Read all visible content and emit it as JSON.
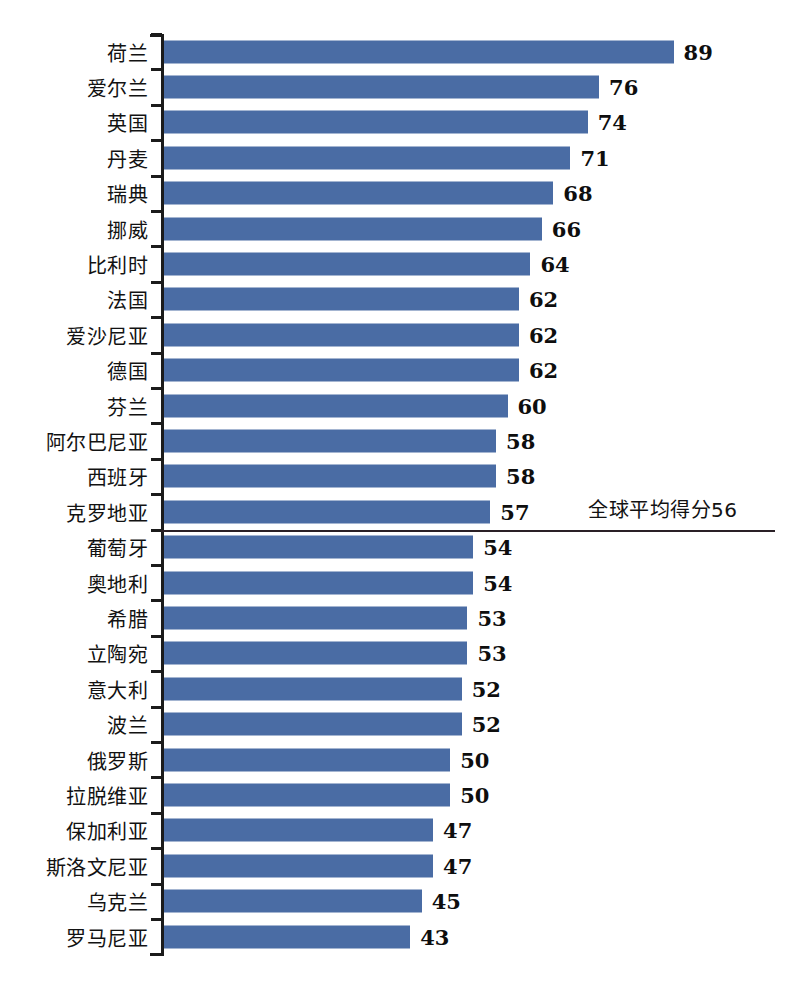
{
  "chart_data": {
    "type": "bar",
    "orientation": "horizontal",
    "title": "",
    "subtitle": "",
    "xlabel": "",
    "ylabel": "",
    "grid": false,
    "legend": null,
    "xlim": [
      0,
      89
    ],
    "categories": [
      "荷兰",
      "爱尔兰",
      "英国",
      "丹麦",
      "瑞典",
      "挪威",
      "比利时",
      "法国",
      "爱沙尼亚",
      "德国",
      "芬兰",
      "阿尔巴尼亚",
      "西班牙",
      "克罗地亚",
      "葡萄牙",
      "奥地利",
      "希腊",
      "立陶宛",
      "意大利",
      "波兰",
      "俄罗斯",
      "拉脱维亚",
      "保加利亚",
      "斯洛文尼亚",
      "乌克兰",
      "罗马尼亚"
    ],
    "values": [
      89,
      76,
      74,
      71,
      68,
      66,
      64,
      62,
      62,
      62,
      60,
      58,
      58,
      57,
      54,
      54,
      53,
      53,
      52,
      52,
      50,
      50,
      47,
      47,
      45,
      43
    ],
    "annotations": [
      {
        "name": "global-average-reference",
        "text": "全球平均得分56",
        "value": 56,
        "after_index": 13
      }
    ],
    "colors": {
      "bar": "#4a6ca4",
      "axis": "#1b1b1b",
      "divider": "#2a2026",
      "text": "#121212",
      "background": "#ffffff"
    }
  }
}
